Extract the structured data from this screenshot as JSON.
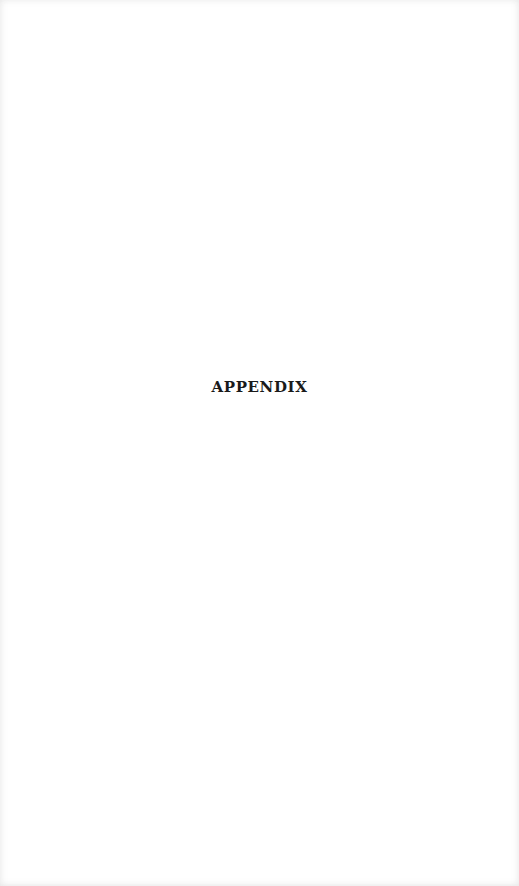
{
  "page": {
    "heading": "APPENDIX"
  }
}
